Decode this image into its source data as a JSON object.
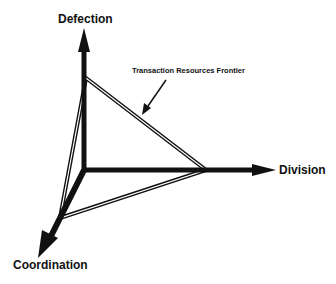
{
  "diagram": {
    "axes": {
      "vertical": "Defection",
      "horizontal": "Division",
      "diagonal": "Coordination"
    },
    "annotation": "Transaction Resources Frontier",
    "colors": {
      "stroke": "#111111",
      "background": "#ffffff"
    }
  }
}
